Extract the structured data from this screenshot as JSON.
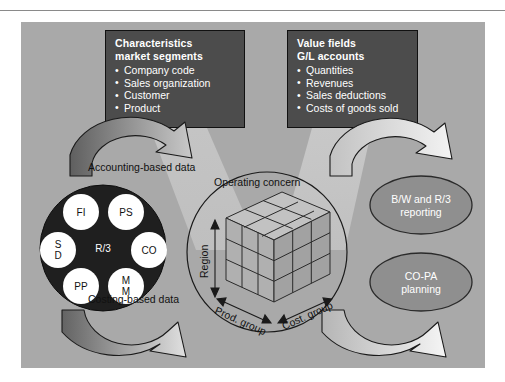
{
  "figure": {
    "title": "Operating concern",
    "center_label": "Operating concern"
  },
  "boxes": {
    "left": {
      "heading_line1": "Characteristics",
      "heading_line2": "market segments",
      "items": [
        "Company code",
        "Sales organization",
        "Customer",
        "Product"
      ]
    },
    "right": {
      "heading_line1": "Value fields",
      "heading_line2": "G/L accounts",
      "items": [
        "Quantities",
        "Revenues",
        "Sales deductions",
        "Costs of goods sold"
      ]
    }
  },
  "flows": {
    "accounting": "Accounting-based data",
    "costing": "Costing-based data"
  },
  "r3": {
    "center": "R/3",
    "modules": [
      {
        "id": "fi",
        "label": "FI",
        "lines": [
          "FI"
        ]
      },
      {
        "id": "ps",
        "label": "PS",
        "lines": [
          "PS"
        ]
      },
      {
        "id": "sd",
        "label": "SD",
        "lines": [
          "S",
          "D"
        ]
      },
      {
        "id": "co",
        "label": "CO",
        "lines": [
          "CO"
        ]
      },
      {
        "id": "pp",
        "label": "PP",
        "lines": [
          "PP"
        ]
      },
      {
        "id": "mm",
        "label": "MM",
        "lines": [
          "M",
          "M"
        ]
      }
    ]
  },
  "cube": {
    "axes": {
      "vertical": "Region",
      "left": "Prod. group",
      "right": "Cost. group"
    },
    "divisions": 3
  },
  "outputs": [
    {
      "id": "bw-reporting",
      "lines": [
        "B/W and R/3",
        "reporting"
      ]
    },
    {
      "id": "copa-planning",
      "lines": [
        "CO-PA",
        "planning"
      ]
    }
  ],
  "colors": {
    "panel": "#a9a9a9",
    "box_fill": "#4c4c4c",
    "box_text": "#ffffff",
    "r3_fill": "#1f1f1f",
    "module_fill": "#ffffff",
    "ellipse_fill": "#8f8f8f",
    "arrow_dark": "#6f6f6f",
    "arrow_light": "#e9e9e9",
    "beam": "#bdbdbd",
    "outline": "#1a1a1a"
  }
}
